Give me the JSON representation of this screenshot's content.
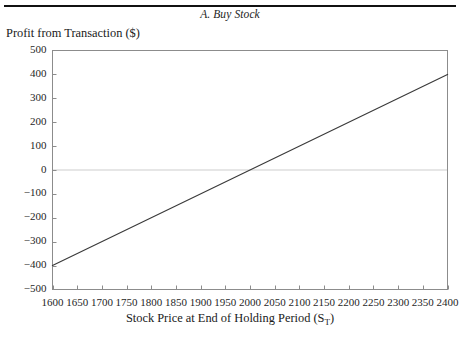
{
  "figure": {
    "header_ghost_text": "",
    "panel_title": "A. Buy Stock",
    "y_axis_title": "Profit from Transaction ($)",
    "x_axis_title_main": "Stock Price at End of Holding Period (S",
    "x_axis_title_sub": "T",
    "x_axis_title_close": ")"
  },
  "chart_data": {
    "type": "line",
    "title": "A. Buy Stock",
    "xlabel": "Stock Price at End of Holding Period (S_T)",
    "ylabel": "Profit from Transaction ($)",
    "xlim": [
      1600,
      2400
    ],
    "ylim": [
      -500,
      500
    ],
    "grid": false,
    "legend": "none",
    "zero_line": true,
    "xticks": [
      1600,
      1650,
      1700,
      1750,
      1800,
      1850,
      1900,
      1950,
      2000,
      2050,
      2100,
      2150,
      2200,
      2250,
      2300,
      2350,
      2400
    ],
    "xtick_labels": [
      "1600",
      "1650",
      "1700",
      "1750",
      "1800",
      "1850",
      "1900",
      "1950",
      "2000",
      "2050",
      "2100",
      "2150",
      "2200",
      "2250",
      "2300",
      "2350",
      "2400"
    ],
    "yticks": [
      -500,
      -400,
      -300,
      -200,
      -100,
      0,
      100,
      200,
      300,
      400,
      500
    ],
    "ytick_labels": [
      "−500",
      "−400",
      "−300",
      "−200",
      "−100",
      "0",
      "100",
      "200",
      "300",
      "400",
      "500"
    ],
    "series": [
      {
        "name": "Profit from buying stock",
        "color": "#3a3a3a",
        "x": [
          1600,
          2400
        ],
        "y": [
          -400,
          400
        ],
        "breakeven_x": 2000,
        "slope": 1,
        "intercept": -2000
      }
    ]
  },
  "colors": {
    "line": "#3a3a3a",
    "frame": "#8c8c8c",
    "zero_line": "#e6e6e6",
    "text": "#1a1a1a",
    "rule": "#111111"
  }
}
